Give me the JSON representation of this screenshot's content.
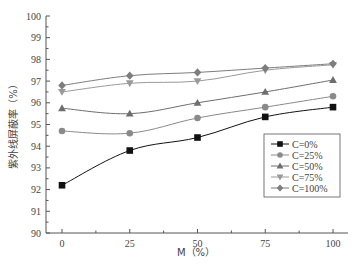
{
  "chart_data": {
    "type": "line",
    "title": "",
    "xlabel": "M（%）",
    "ylabel": "紫外线屏蔽率（%）",
    "x": [
      0,
      25,
      50,
      75,
      100
    ],
    "xticks": [
      0,
      25,
      50,
      75,
      100
    ],
    "xlim": [
      -5,
      108
    ],
    "yticks": [
      90,
      91,
      92,
      93,
      94,
      95,
      96,
      97,
      98,
      99,
      100
    ],
    "ylim": [
      90,
      100
    ],
    "grid": false,
    "legend_position": "lower right (inside)",
    "series": [
      {
        "name": "C=0%",
        "marker": "square",
        "color": "#111111",
        "values": [
          92.2,
          93.8,
          94.4,
          95.35,
          95.8
        ]
      },
      {
        "name": "C=25%",
        "marker": "circle",
        "color": "#8a8a8a",
        "values": [
          94.7,
          94.6,
          95.3,
          95.8,
          96.3
        ]
      },
      {
        "name": "C=50%",
        "marker": "triangle-up",
        "color": "#6e6e6e",
        "values": [
          95.75,
          95.5,
          96.0,
          96.5,
          97.05
        ]
      },
      {
        "name": "C=75%",
        "marker": "triangle-down",
        "color": "#9a9a9a",
        "values": [
          96.5,
          96.9,
          97.0,
          97.5,
          97.75
        ]
      },
      {
        "name": "C=100%",
        "marker": "diamond",
        "color": "#7d7d7d",
        "values": [
          96.8,
          97.25,
          97.4,
          97.6,
          97.8
        ]
      }
    ]
  }
}
